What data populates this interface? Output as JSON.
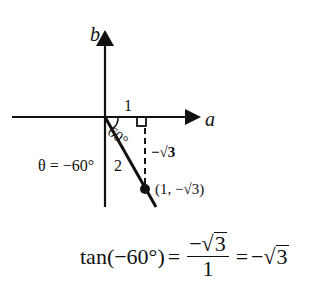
{
  "diagram": {
    "axes": {
      "x_label": "a",
      "y_label": "b"
    },
    "labels": {
      "adjacent": "1",
      "hypotenuse": "2",
      "opposite": "−√3",
      "angle_inner": "60°",
      "theta": "θ = −60°",
      "point": "(1, −√3)"
    },
    "colors": {
      "ink": "#111111",
      "background": "#ffffff"
    }
  },
  "equation": {
    "lhs": "tan(−60°)",
    "eq1": "=",
    "frac_num_sign": "−",
    "frac_num_radicand": "3",
    "frac_den": "1",
    "eq2": "=",
    "rhs_sign": "−",
    "rhs_radicand": "3",
    "radical": "√"
  }
}
